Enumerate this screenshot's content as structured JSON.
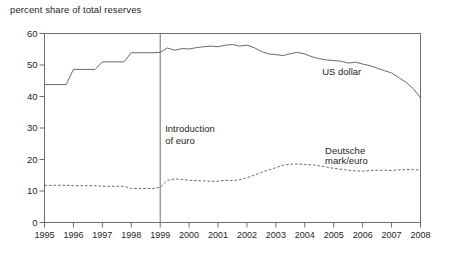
{
  "chart_data": {
    "type": "line",
    "title": "percent share of total reserves",
    "xlabel": "",
    "ylabel": "percent share of total reserves",
    "xlim": [
      1995,
      2008
    ],
    "ylim": [
      0,
      60
    ],
    "yticks": [
      0,
      10,
      20,
      30,
      40,
      50,
      60
    ],
    "xticks": [
      1995,
      1996,
      1997,
      1998,
      1999,
      2000,
      2001,
      2002,
      2003,
      2004,
      2005,
      2006,
      2007,
      2008
    ],
    "grid": false,
    "legend_position": "inline-annotation",
    "annotations": [
      {
        "name": "introduction-of-euro",
        "text": "Introduction\nof euro",
        "x": 1999,
        "type": "vertical-line-with-label"
      }
    ],
    "series": [
      {
        "name": "US dollar",
        "style": "solid",
        "color": "#58595b",
        "label_x": 2004.6,
        "label_y": 47.5,
        "x": [
          1995,
          1995.75,
          1996,
          1996.75,
          1997,
          1997.75,
          1998,
          1998.75,
          1999,
          1999.25,
          1999.5,
          1999.75,
          2000,
          2000.25,
          2000.5,
          2000.75,
          2001,
          2001.25,
          2001.5,
          2001.75,
          2002,
          2002.25,
          2002.5,
          2002.75,
          2003,
          2003.25,
          2003.5,
          2003.75,
          2004,
          2004.25,
          2004.5,
          2004.75,
          2005,
          2005.25,
          2005.5,
          2005.75,
          2006,
          2006.25,
          2006.5,
          2006.75,
          2007,
          2007.25,
          2007.5,
          2007.75,
          2008
        ],
        "values": [
          43.8,
          43.8,
          48.6,
          48.6,
          51.0,
          51.0,
          53.9,
          53.9,
          54.0,
          55.4,
          54.7,
          55.2,
          55.1,
          55.5,
          55.8,
          56.0,
          55.8,
          56.3,
          56.5,
          56.0,
          56.3,
          55.5,
          54.3,
          53.5,
          53.3,
          53.0,
          53.6,
          54.0,
          53.5,
          52.6,
          52.0,
          51.6,
          51.4,
          51.2,
          50.6,
          50.9,
          50.3,
          49.8,
          49.0,
          48.2,
          47.5,
          46.0,
          44.5,
          42.5,
          39.6
        ]
      },
      {
        "name": "Deutsche mark/euro",
        "style": "dashed",
        "color": "#58595b",
        "label_x": 2004.7,
        "label_y": 22.5,
        "x": [
          1995,
          1995.75,
          1996,
          1996.75,
          1997,
          1997.75,
          1998,
          1998.75,
          1999,
          1999.25,
          1999.5,
          1999.75,
          2000,
          2000.25,
          2000.5,
          2000.75,
          2001,
          2001.25,
          2001.5,
          2001.75,
          2002,
          2002.25,
          2002.5,
          2002.75,
          2003,
          2003.25,
          2003.5,
          2003.75,
          2004,
          2004.25,
          2004.5,
          2004.75,
          2005,
          2005.25,
          2005.5,
          2005.75,
          2006,
          2006.25,
          2006.5,
          2006.75,
          2007,
          2007.25,
          2007.5,
          2007.75,
          2008
        ],
        "values": [
          11.8,
          11.8,
          11.7,
          11.7,
          11.5,
          11.5,
          10.8,
          10.8,
          11.2,
          13.4,
          13.8,
          13.7,
          13.4,
          13.3,
          13.2,
          13.1,
          13.1,
          13.4,
          13.3,
          13.6,
          14.2,
          15.0,
          15.9,
          16.7,
          17.4,
          18.2,
          18.5,
          18.6,
          18.4,
          18.3,
          18.0,
          17.6,
          17.2,
          16.9,
          16.6,
          16.4,
          16.3,
          16.5,
          16.6,
          16.6,
          16.5,
          16.7,
          16.8,
          16.8,
          16.7
        ]
      }
    ]
  },
  "axis": {
    "ytick_labels": [
      "60",
      "50",
      "40",
      "30",
      "20",
      "10",
      "0"
    ],
    "xtick_labels": [
      "1995",
      "1996",
      "1997",
      "1998",
      "1999",
      "2000",
      "2001",
      "2002",
      "2003",
      "2004",
      "2005",
      "2006",
      "2007",
      "2008"
    ]
  },
  "labels": {
    "chart_title": "percent share of total reserves",
    "us_dollar": "US dollar",
    "deutsche_mark_euro": "Deutsche\nmark/euro",
    "introduction_of_euro": "Introduction\nof euro"
  },
  "colors": {
    "line": "#58595b",
    "axis": "#6d6e71",
    "text": "#231f20",
    "background": "#ffffff"
  }
}
